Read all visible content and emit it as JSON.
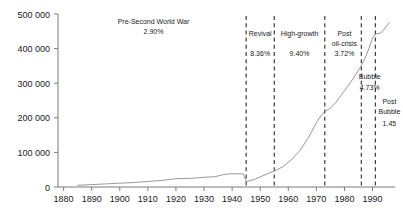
{
  "chart_data": {
    "type": "line",
    "title": "",
    "xlabel": "",
    "ylabel": "",
    "xlim": [
      1878,
      1998
    ],
    "ylim": [
      0,
      500000
    ],
    "grid": false,
    "legend": "none",
    "y_ticks": [
      0,
      100000,
      200000,
      300000,
      400000,
      500000
    ],
    "y_tick_labels": [
      "0",
      "100 000",
      "200 000",
      "300 000",
      "400 000",
      "500 000"
    ],
    "x_ticks": [
      1880,
      1890,
      1900,
      1910,
      1920,
      1930,
      1940,
      1950,
      1960,
      1970,
      1980,
      1990
    ],
    "x_tick_labels": [
      "1880",
      "1890",
      "1900",
      "1910",
      "1920",
      "1930",
      "1940",
      "1950",
      "1960",
      "1970",
      "1980",
      "1990"
    ],
    "series": [
      {
        "name": "series-1",
        "color": "#8c8c8c",
        "x": [
          1885,
          1890,
          1895,
          1900,
          1905,
          1910,
          1915,
          1920,
          1925,
          1930,
          1934,
          1937,
          1939,
          1941,
          1944,
          1945,
          1948,
          1951,
          1955,
          1958,
          1961,
          1964,
          1967,
          1970,
          1972,
          1973,
          1975,
          1977,
          1980,
          1983,
          1986,
          1988,
          1990,
          1991,
          1993,
          1996
        ],
        "y": [
          5000,
          7000,
          9000,
          11000,
          13000,
          16000,
          19000,
          24000,
          25000,
          28000,
          30000,
          36000,
          38000,
          38000,
          38000,
          15000,
          22000,
          33000,
          46000,
          58000,
          78000,
          104000,
          140000,
          186000,
          210000,
          218000,
          228000,
          245000,
          278000,
          312000,
          350000,
          385000,
          430000,
          442000,
          445000,
          475000
        ]
      }
    ],
    "period_boundaries": [
      1945,
      1955,
      1973,
      1986,
      1991
    ],
    "annotations": [
      {
        "id": "pre-war",
        "label": "Pre-Second World War",
        "value": "2.90%",
        "x_center": 1912,
        "label_y": 24,
        "value_y": 34
      },
      {
        "id": "revival",
        "label": "Revival",
        "value": "8.36%",
        "x_center": 1950,
        "label_y": 36,
        "value_y": 56
      },
      {
        "id": "high-growth",
        "label": "High-growth",
        "value": "9.40%",
        "x_center": 1964,
        "label_y": 36,
        "value_y": 56
      },
      {
        "id": "post-oil",
        "label_line1": "Post",
        "label_line2": "oil-crisis",
        "value": "3.72%",
        "x_center": 1980,
        "label_y": 36,
        "value_y": 56
      },
      {
        "id": "bubble",
        "label": "Bubble",
        "value": "4.73%",
        "x_center": 1989,
        "label_y": 79,
        "value_y": 90
      },
      {
        "id": "post-bubble",
        "label_line1": "Post",
        "label_line2": "Bubble",
        "value": "1.45",
        "x_center": 1996,
        "label_y": 104,
        "value_y": 126
      }
    ]
  }
}
